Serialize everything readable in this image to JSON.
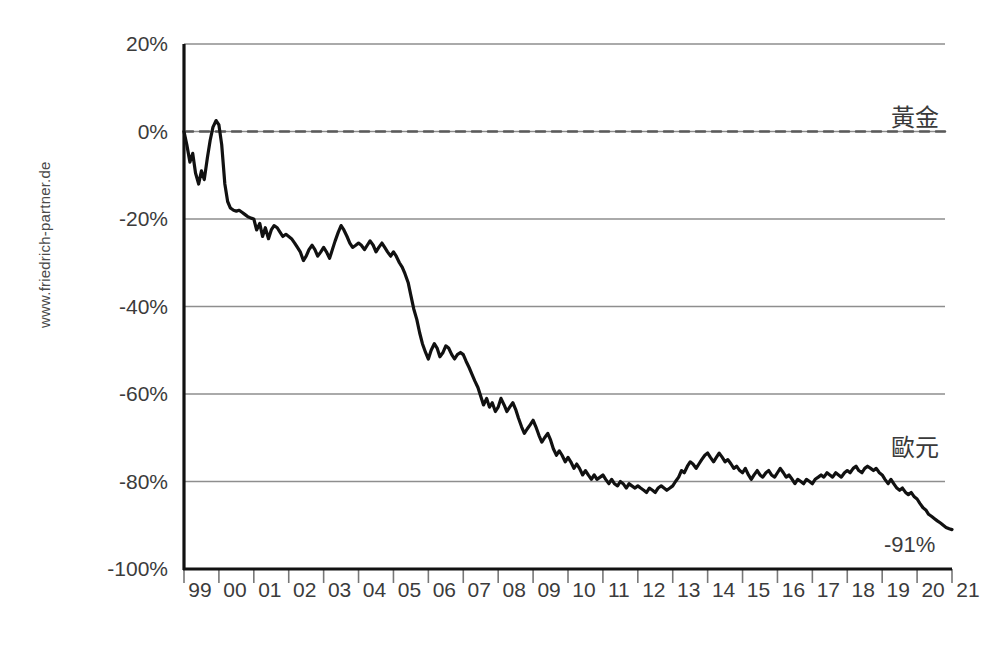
{
  "watermark": {
    "text": "www.friedrich-partner.de"
  },
  "annotations": {
    "gold_label": "黃金",
    "euro_label": "歐元",
    "end_value_label": "-91%"
  },
  "chart_data": {
    "type": "line",
    "title": "",
    "subtitle": "",
    "xlabel": "",
    "ylabel": "",
    "grid": true,
    "legend_position": "inline-right",
    "xlim": [
      1999,
      2021
    ],
    "ylim": [
      -100,
      20
    ],
    "ytick_labels": [
      "20%",
      "0%",
      "-20%",
      "-40%",
      "-60%",
      "-80%",
      "-100%"
    ],
    "ytick_values": [
      20,
      0,
      -20,
      -40,
      -60,
      -80,
      -100
    ],
    "xtick_labels": [
      "99",
      "00",
      "01",
      "02",
      "03",
      "04",
      "05",
      "06",
      "07",
      "08",
      "09",
      "10",
      "11",
      "12",
      "13",
      "14",
      "15",
      "16",
      "17",
      "18",
      "19",
      "20",
      "21"
    ],
    "xtick_values": [
      1999,
      2000,
      2001,
      2002,
      2003,
      2004,
      2005,
      2006,
      2007,
      2008,
      2009,
      2010,
      2011,
      2012,
      2013,
      2014,
      2015,
      2016,
      2017,
      2018,
      2019,
      2020,
      2021
    ],
    "series": [
      {
        "name": "黃金",
        "style": "dashed",
        "color": "#5a5a5a",
        "x": [
          1999,
          2021
        ],
        "values": [
          0,
          0
        ]
      },
      {
        "name": "歐元",
        "style": "solid",
        "color": "#111111",
        "annotation_end": "-91%",
        "x": [
          1999.0,
          1999.08,
          1999.17,
          1999.25,
          1999.33,
          1999.42,
          1999.5,
          1999.58,
          1999.67,
          1999.75,
          1999.83,
          1999.92,
          2000.0,
          2000.08,
          2000.17,
          2000.25,
          2000.33,
          2000.42,
          2000.5,
          2000.58,
          2000.67,
          2000.75,
          2000.83,
          2000.92,
          2001.0,
          2001.08,
          2001.17,
          2001.25,
          2001.33,
          2001.42,
          2001.5,
          2001.58,
          2001.67,
          2001.75,
          2001.83,
          2001.92,
          2002.0,
          2002.08,
          2002.17,
          2002.25,
          2002.33,
          2002.42,
          2002.5,
          2002.58,
          2002.67,
          2002.75,
          2002.83,
          2002.92,
          2003.0,
          2003.08,
          2003.17,
          2003.25,
          2003.33,
          2003.42,
          2003.5,
          2003.58,
          2003.67,
          2003.75,
          2003.83,
          2003.92,
          2004.0,
          2004.08,
          2004.17,
          2004.25,
          2004.33,
          2004.42,
          2004.5,
          2004.58,
          2004.67,
          2004.75,
          2004.83,
          2004.92,
          2005.0,
          2005.08,
          2005.17,
          2005.25,
          2005.33,
          2005.42,
          2005.5,
          2005.58,
          2005.67,
          2005.75,
          2005.83,
          2005.92,
          2006.0,
          2006.08,
          2006.17,
          2006.25,
          2006.33,
          2006.42,
          2006.5,
          2006.58,
          2006.67,
          2006.75,
          2006.83,
          2006.92,
          2007.0,
          2007.08,
          2007.17,
          2007.25,
          2007.33,
          2007.42,
          2007.5,
          2007.58,
          2007.67,
          2007.75,
          2007.83,
          2007.92,
          2008.0,
          2008.08,
          2008.17,
          2008.25,
          2008.33,
          2008.42,
          2008.5,
          2008.58,
          2008.67,
          2008.75,
          2008.83,
          2008.92,
          2009.0,
          2009.08,
          2009.17,
          2009.25,
          2009.33,
          2009.42,
          2009.5,
          2009.58,
          2009.67,
          2009.75,
          2009.83,
          2009.92,
          2010.0,
          2010.08,
          2010.17,
          2010.25,
          2010.33,
          2010.42,
          2010.5,
          2010.58,
          2010.67,
          2010.75,
          2010.83,
          2010.92,
          2011.0,
          2011.08,
          2011.17,
          2011.25,
          2011.33,
          2011.42,
          2011.5,
          2011.58,
          2011.67,
          2011.75,
          2011.83,
          2011.92,
          2012.0,
          2012.08,
          2012.17,
          2012.25,
          2012.33,
          2012.42,
          2012.5,
          2012.58,
          2012.67,
          2012.75,
          2012.83,
          2012.92,
          2013.0,
          2013.08,
          2013.17,
          2013.25,
          2013.33,
          2013.42,
          2013.5,
          2013.58,
          2013.67,
          2013.75,
          2013.83,
          2013.92,
          2014.0,
          2014.08,
          2014.17,
          2014.25,
          2014.33,
          2014.42,
          2014.5,
          2014.58,
          2014.67,
          2014.75,
          2014.83,
          2014.92,
          2015.0,
          2015.08,
          2015.17,
          2015.25,
          2015.33,
          2015.42,
          2015.5,
          2015.58,
          2015.67,
          2015.75,
          2015.83,
          2015.92,
          2016.0,
          2016.08,
          2016.17,
          2016.25,
          2016.33,
          2016.42,
          2016.5,
          2016.58,
          2016.67,
          2016.75,
          2016.83,
          2016.92,
          2017.0,
          2017.08,
          2017.17,
          2017.25,
          2017.33,
          2017.42,
          2017.5,
          2017.58,
          2017.67,
          2017.75,
          2017.83,
          2017.92,
          2018.0,
          2018.08,
          2018.17,
          2018.25,
          2018.33,
          2018.42,
          2018.5,
          2018.58,
          2018.67,
          2018.75,
          2018.83,
          2018.92,
          2019.0,
          2019.08,
          2019.17,
          2019.25,
          2019.33,
          2019.42,
          2019.5,
          2019.58,
          2019.67,
          2019.75,
          2019.83,
          2019.92,
          2020.0,
          2020.08,
          2020.17,
          2020.25,
          2020.33,
          2020.42,
          2020.5,
          2020.58,
          2020.67,
          2020.75,
          2020.83,
          2020.92,
          2021.0
        ],
        "values": [
          0.0,
          -3.0,
          -7.0,
          -5.0,
          -9.5,
          -12.0,
          -9.0,
          -11.0,
          -6.0,
          -2.0,
          1.0,
          2.5,
          1.5,
          -3.0,
          -12.0,
          -16.0,
          -17.5,
          -18.0,
          -18.2,
          -18.0,
          -18.5,
          -19.0,
          -19.5,
          -19.8,
          -20.0,
          -22.5,
          -21.0,
          -24.0,
          -22.0,
          -24.5,
          -22.5,
          -21.5,
          -22.0,
          -23.0,
          -24.0,
          -23.5,
          -24.0,
          -24.5,
          -25.5,
          -26.5,
          -27.5,
          -29.5,
          -28.5,
          -27.0,
          -26.0,
          -27.0,
          -28.5,
          -27.5,
          -26.5,
          -27.5,
          -29.0,
          -27.0,
          -25.0,
          -23.0,
          -21.5,
          -22.5,
          -24.0,
          -25.5,
          -26.5,
          -26.0,
          -25.5,
          -26.0,
          -27.0,
          -26.0,
          -25.0,
          -26.0,
          -27.5,
          -26.5,
          -25.5,
          -26.5,
          -27.5,
          -28.5,
          -27.5,
          -28.5,
          -30.0,
          -31.0,
          -32.5,
          -34.5,
          -37.5,
          -40.5,
          -43.0,
          -46.0,
          -48.5,
          -50.5,
          -52.0,
          -50.0,
          -48.5,
          -49.5,
          -51.5,
          -50.5,
          -49.0,
          -49.5,
          -51.0,
          -52.0,
          -51.0,
          -50.5,
          -51.0,
          -52.5,
          -54.0,
          -55.5,
          -57.0,
          -58.5,
          -60.5,
          -62.5,
          -61.0,
          -63.0,
          -62.0,
          -64.0,
          -63.0,
          -61.0,
          -62.5,
          -64.0,
          -63.0,
          -62.0,
          -63.5,
          -65.5,
          -67.5,
          -69.0,
          -68.0,
          -67.0,
          -66.0,
          -67.5,
          -69.5,
          -71.0,
          -70.0,
          -69.0,
          -70.5,
          -72.5,
          -74.0,
          -73.0,
          -74.0,
          -75.5,
          -74.5,
          -75.5,
          -77.0,
          -76.0,
          -77.0,
          -78.5,
          -77.5,
          -78.5,
          -79.5,
          -78.5,
          -79.5,
          -79.0,
          -78.5,
          -79.5,
          -80.5,
          -79.5,
          -80.5,
          -81.0,
          -80.0,
          -80.5,
          -81.5,
          -80.5,
          -81.0,
          -81.5,
          -81.0,
          -81.5,
          -82.0,
          -82.5,
          -81.5,
          -82.0,
          -82.5,
          -81.5,
          -81.0,
          -81.5,
          -82.0,
          -81.5,
          -81.0,
          -80.0,
          -79.0,
          -77.5,
          -78.0,
          -76.5,
          -75.5,
          -76.0,
          -77.0,
          -76.0,
          -75.0,
          -74.0,
          -73.5,
          -74.5,
          -75.5,
          -74.5,
          -73.5,
          -74.5,
          -75.5,
          -75.0,
          -76.0,
          -77.0,
          -76.5,
          -77.5,
          -78.0,
          -77.0,
          -78.5,
          -79.5,
          -78.5,
          -77.5,
          -78.5,
          -79.0,
          -78.0,
          -77.5,
          -78.5,
          -79.0,
          -78.0,
          -77.0,
          -78.0,
          -79.0,
          -78.5,
          -79.5,
          -80.5,
          -79.5,
          -80.0,
          -80.5,
          -79.5,
          -80.0,
          -80.5,
          -79.5,
          -79.0,
          -78.5,
          -79.0,
          -78.0,
          -78.5,
          -79.0,
          -78.0,
          -78.5,
          -79.0,
          -78.0,
          -77.5,
          -78.0,
          -77.0,
          -76.5,
          -77.5,
          -78.0,
          -77.0,
          -76.5,
          -77.0,
          -77.5,
          -77.0,
          -78.0,
          -78.5,
          -79.5,
          -80.5,
          -79.5,
          -80.5,
          -81.5,
          -82.0,
          -81.5,
          -82.5,
          -83.0,
          -82.5,
          -83.5,
          -84.0,
          -85.0,
          -86.0,
          -86.5,
          -87.5,
          -88.0,
          -88.5,
          -89.0,
          -89.5,
          -90.0,
          -90.5,
          -90.8,
          -91.0
        ]
      }
    ]
  }
}
